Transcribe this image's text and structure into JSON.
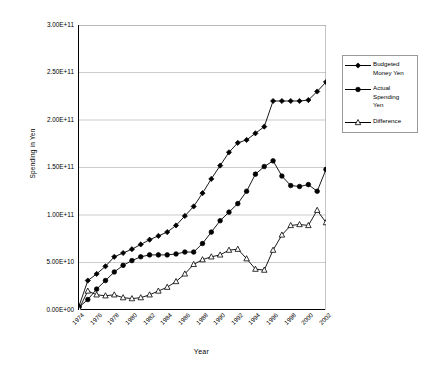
{
  "chart_data": {
    "type": "line",
    "title": "",
    "xlabel": "Year",
    "ylabel": "Spending in Yen",
    "grid": true,
    "legend_position": "right",
    "xlim": [
      1974,
      2002
    ],
    "ylim": [
      0,
      300000000000
    ],
    "ytick_labels": [
      "3.00E+11",
      "2.50E+11",
      "2.00E+11",
      "1.50E+11",
      "1.00E+11",
      "5.00E+10",
      "0.00E+00"
    ],
    "ytick_values": [
      300000000000,
      250000000000,
      200000000000,
      150000000000,
      100000000000,
      50000000000,
      0
    ],
    "xtick_labels": [
      "1974",
      "1976",
      "1978",
      "1980",
      "1982",
      "1984",
      "1986",
      "1988",
      "1990",
      "1992",
      "1994",
      "1996",
      "1998",
      "2000",
      "2002"
    ],
    "xtick_values": [
      1974,
      1976,
      1978,
      1980,
      1982,
      1984,
      1986,
      1988,
      1990,
      1992,
      1994,
      1996,
      1998,
      2000,
      2002
    ],
    "x": [
      1974,
      1975,
      1976,
      1977,
      1978,
      1979,
      1980,
      1981,
      1982,
      1983,
      1984,
      1985,
      1986,
      1987,
      1988,
      1989,
      1990,
      1991,
      1992,
      1993,
      1994,
      1995,
      1996,
      1997,
      1998,
      1999,
      2000,
      2001,
      2002
    ],
    "series": [
      {
        "name": "Budgeted Money Yen",
        "marker": "diamond",
        "marker_fill": "#000000",
        "color": "#000000",
        "values": [
          4000000000.0,
          31000000000.0,
          38000000000.0,
          46000000000.0,
          56000000000.0,
          60000000000.0,
          64000000000.0,
          69000000000.0,
          74000000000.0,
          78000000000.0,
          82000000000.0,
          89000000000.0,
          99000000000.0,
          109000000000.0,
          123000000000.0,
          138000000000.0,
          152000000000.0,
          166000000000.0,
          176000000000.0,
          179000000000.0,
          186000000000.0,
          193000000000.0,
          220000000000.0,
          220000000000.0,
          220000000000.0,
          220000000000.0,
          221000000000.0,
          230000000000.0,
          240000000000.0
        ]
      },
      {
        "name": "Actual Spending Yen",
        "marker": "circle",
        "marker_fill": "#000000",
        "color": "#000000",
        "values": [
          3000000000.0,
          11000000000.0,
          22000000000.0,
          31000000000.0,
          40000000000.0,
          47000000000.0,
          52000000000.0,
          56000000000.0,
          58000000000.0,
          58000000000.0,
          58000000000.0,
          59000000000.0,
          61000000000.0,
          61000000000.0,
          70000000000.0,
          82000000000.0,
          94000000000.0,
          103000000000.0,
          112000000000.0,
          125000000000.0,
          143000000000.0,
          151000000000.0,
          157000000000.0,
          141000000000.0,
          131000000000.0,
          130000000000.0,
          132000000000.0,
          125000000000.0,
          148000000000.0
        ]
      },
      {
        "name": "Difference",
        "marker": "triangle",
        "marker_fill": "#ffffff",
        "color": "#000000",
        "values": [
          1000000000.0,
          20000000000.0,
          16000000000.0,
          15000000000.0,
          16000000000.0,
          13000000000.0,
          12000000000.0,
          13000000000.0,
          16000000000.0,
          20000000000.0,
          24000000000.0,
          30000000000.0,
          38000000000.0,
          48000000000.0,
          53000000000.0,
          56000000000.0,
          58000000000.0,
          63000000000.0,
          64000000000.0,
          54000000000.0,
          43000000000.0,
          42000000000.0,
          63000000000.0,
          79000000000.0,
          89000000000.0,
          90000000000.0,
          89000000000.0,
          105000000000.0,
          92000000000.0
        ]
      }
    ]
  },
  "legend": {
    "items": [
      {
        "label_lines": [
          "Budgeted",
          "Money Yen"
        ],
        "marker": "diamond"
      },
      {
        "label_lines": [
          "Actual",
          "Spending",
          "Yen"
        ],
        "marker": "circle"
      },
      {
        "label_lines": [
          "Difference"
        ],
        "marker": "triangle"
      }
    ]
  },
  "axes": {
    "y_title": "Spending in Yen",
    "x_title": "Year"
  }
}
